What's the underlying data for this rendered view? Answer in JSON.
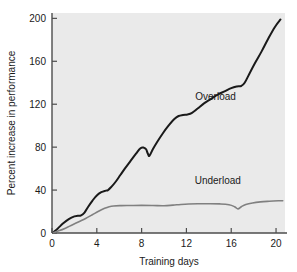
{
  "chart_data": {
    "type": "line",
    "title": "",
    "xlabel": "Training days",
    "ylabel": "Percent increase in performance",
    "xlim": [
      0,
      20.8
    ],
    "ylim": [
      0,
      205
    ],
    "xticks": [
      "0",
      "4",
      "8",
      "12",
      "16",
      "20"
    ],
    "xtick_values": [
      0,
      4,
      8,
      12,
      16,
      20
    ],
    "yticks": [
      "0",
      "40",
      "80",
      "120",
      "160",
      "200"
    ],
    "ytick_values": [
      0,
      40,
      80,
      120,
      160,
      200
    ],
    "grid": false,
    "legend": "inline-labels",
    "plot_bg": "#eaeaea",
    "figure_bg": "#ffffff",
    "axis_color": "#4d4d4d",
    "series": [
      {
        "name": "Overload",
        "color": "#1a1a1a",
        "width": 2,
        "label_x": 14.6,
        "label_y": 124,
        "x": [
          0.15,
          0.5,
          1.0,
          1.5,
          2.0,
          2.3,
          2.6,
          2.9,
          3.2,
          3.6,
          4.0,
          4.4,
          4.8,
          5.0,
          5.3,
          5.7,
          6.1,
          6.5,
          7.0,
          7.5,
          7.9,
          8.2,
          8.4,
          8.55,
          8.7,
          9.0,
          9.4,
          9.9,
          10.4,
          10.9,
          11.3,
          11.7,
          12.1,
          12.5,
          13.0,
          13.6,
          14.2,
          14.8,
          15.4,
          16.0,
          16.5,
          16.9,
          17.2,
          17.6,
          18.1,
          18.7,
          19.3,
          19.9,
          20.4
        ],
        "y": [
          1,
          4,
          9,
          13,
          15.5,
          16,
          16.5,
          19,
          24,
          30,
          35,
          38,
          39.5,
          40,
          43,
          48,
          54,
          60,
          67,
          74,
          79,
          79.5,
          78,
          74,
          72,
          78,
          85,
          93,
          100,
          106,
          109,
          110,
          110.5,
          112,
          116,
          121,
          125,
          129,
          132,
          135,
          136.5,
          137,
          140,
          148,
          158,
          169,
          181,
          192,
          199
        ]
      },
      {
        "name": "Underload",
        "color": "#808080",
        "width": 1.6,
        "label_x": 14.8,
        "label_y": 46,
        "x": [
          0.15,
          0.6,
          1.2,
          1.8,
          2.4,
          3.0,
          3.6,
          4.2,
          4.7,
          5.1,
          5.5,
          6.2,
          7.0,
          8.0,
          9.0,
          10.0,
          10.8,
          11.5,
          12.2,
          13.0,
          14.0,
          15.0,
          15.8,
          16.3,
          16.6,
          16.9,
          17.3,
          17.9,
          18.6,
          19.4,
          20.2,
          20.6
        ],
        "y": [
          0.5,
          2,
          4.5,
          7.5,
          10.5,
          13.5,
          17,
          20.5,
          23,
          24.5,
          25.2,
          25.5,
          25.6,
          25.7,
          25.6,
          25.4,
          26.0,
          26.6,
          27.0,
          27.2,
          27.3,
          27.1,
          26.3,
          24.5,
          22.5,
          24.5,
          26.5,
          28.0,
          29.0,
          29.6,
          30.0,
          30.1
        ]
      }
    ]
  }
}
